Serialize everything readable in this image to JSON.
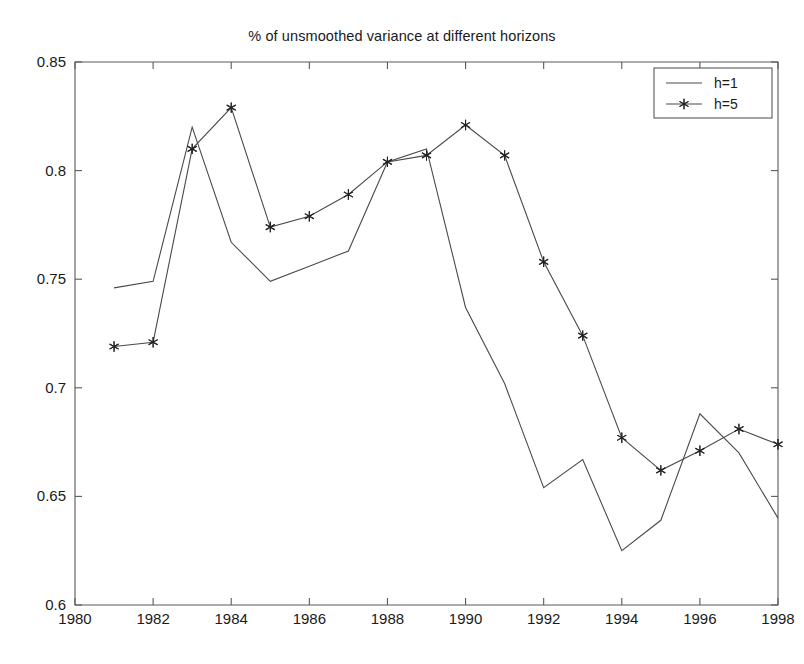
{
  "chart_data": {
    "type": "line",
    "title": "% of unsmoothed variance at different horizons",
    "xlabel": "",
    "ylabel": "",
    "xlim": [
      1980,
      1998
    ],
    "ylim": [
      0.6,
      0.85
    ],
    "xticks": [
      1980,
      1982,
      1984,
      1986,
      1988,
      1990,
      1992,
      1994,
      1996,
      1998
    ],
    "xtick_labels": [
      "1980",
      "1982",
      "1984",
      "1986",
      "1988",
      "1990",
      "1992",
      "1994",
      "1996",
      "1998"
    ],
    "yticks": [
      0.6,
      0.65,
      0.7,
      0.75,
      0.8,
      0.85
    ],
    "ytick_labels": [
      "0.6",
      "0.65",
      "0.7",
      "0.75",
      "0.8",
      "0.85"
    ],
    "grid": false,
    "legend_position": "top-right",
    "x": [
      1981,
      1982,
      1983,
      1984,
      1985,
      1986,
      1987,
      1988,
      1989,
      1990,
      1991,
      1992,
      1993,
      1994,
      1995,
      1996,
      1997,
      1998
    ],
    "series": [
      {
        "name": "h=1",
        "marker": "none",
        "color": "#4a4a4a",
        "values": [
          0.746,
          0.749,
          0.82,
          0.767,
          0.749,
          0.756,
          0.763,
          0.804,
          0.81,
          0.737,
          0.702,
          0.654,
          0.667,
          0.625,
          0.639,
          0.688,
          0.67,
          0.64
        ]
      },
      {
        "name": "h=5",
        "marker": "star",
        "color": "#4a4a4a",
        "values": [
          0.719,
          0.721,
          0.81,
          0.829,
          0.774,
          0.779,
          0.789,
          0.804,
          0.807,
          0.821,
          0.807,
          0.758,
          0.724,
          0.677,
          0.662,
          0.671,
          0.681,
          0.674
        ]
      }
    ]
  },
  "legend": {
    "entries": [
      {
        "label": "h=1",
        "marker": "none"
      },
      {
        "label": "h=5",
        "marker": "star"
      }
    ]
  },
  "axes": {
    "colors": {
      "axis": "#5a5a5a",
      "line": "#4a4a4a",
      "marker": "#222222",
      "text": "#1a1a1a",
      "background": "#ffffff"
    }
  }
}
